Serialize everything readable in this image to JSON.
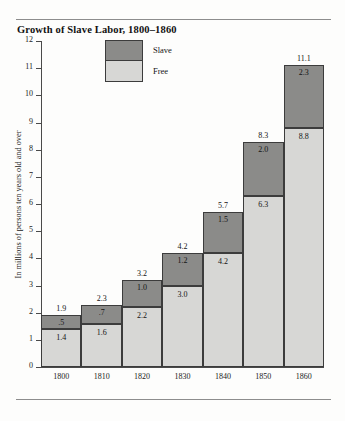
{
  "figure": {
    "title": "Growth of Slave Labor, 1800–1860"
  },
  "legend": {
    "items": [
      {
        "label": "Slave",
        "color": "#8b8b89",
        "key": "slave"
      },
      {
        "label": "Free",
        "color": "#d7d7d5",
        "key": "free"
      }
    ]
  },
  "axes": {
    "y_title": "In millions of persons ten years old and over",
    "y_ticks": [
      "0",
      "1",
      "2",
      "3",
      "4",
      "5",
      "6",
      "7",
      "8",
      "9",
      "10",
      "11",
      "12"
    ],
    "x_ticks": [
      "1800",
      "1810",
      "1820",
      "1830",
      "1840",
      "1850",
      "1860"
    ]
  },
  "bar_labels": {
    "b0": {
      "total": "1.9",
      "slave": ".5",
      "free": "1.4"
    },
    "b1": {
      "total": "2.3",
      "slave": ".7",
      "free": "1.6"
    },
    "b2": {
      "total": "3.2",
      "slave": "1.0",
      "free": "2.2"
    },
    "b3": {
      "total": "4.2",
      "slave": "1.2",
      "free": "3.0"
    },
    "b4": {
      "total": "5.7",
      "slave": "1.5",
      "free": "4.2"
    },
    "b5": {
      "total": "8.3",
      "slave": "2.0",
      "free": "6.3"
    },
    "b6": {
      "total": "11.1",
      "slave": "2.3",
      "free": "8.8"
    }
  },
  "chart_data": {
    "type": "bar",
    "subtype": "stacked",
    "title": "Growth of Slave Labor, 1800–1860",
    "xlabel": "",
    "ylabel": "In millions of persons ten years old and over",
    "categories": [
      "1800",
      "1810",
      "1820",
      "1830",
      "1840",
      "1850",
      "1860"
    ],
    "series": [
      {
        "name": "Free",
        "color": "#d7d7d5",
        "values": [
          1.4,
          1.6,
          2.2,
          3.0,
          4.2,
          6.3,
          8.8
        ]
      },
      {
        "name": "Slave",
        "color": "#8b8b89",
        "values": [
          0.5,
          0.7,
          1.0,
          1.2,
          1.5,
          2.0,
          2.3
        ]
      }
    ],
    "totals": [
      1.9,
      2.3,
      3.2,
      4.2,
      5.7,
      8.3,
      11.1
    ],
    "ylim": [
      0,
      12
    ],
    "ytick_step": 1,
    "grid": false,
    "legend_position": "top-center-inside",
    "data_labels": true
  }
}
